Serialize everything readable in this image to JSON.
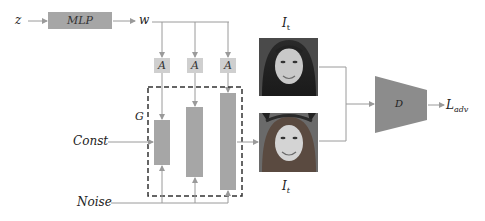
{
  "diagram": {
    "inputs": {
      "z": "z",
      "const": "Const",
      "noise": "Noise"
    },
    "mlp": {
      "label": "MLP"
    },
    "w": "w",
    "adain_blocks": [
      {
        "label": "A"
      },
      {
        "label": "A"
      },
      {
        "label": "A"
      }
    ],
    "generator": {
      "label": "G",
      "num_layers": 3
    },
    "images": {
      "real": {
        "label_main": "I",
        "label_sub": "t",
        "description": "real face image (dark hair, smiling)"
      },
      "generated": {
        "label_main": "I",
        "label_sub": "t",
        "description": "generated face image (cat-ear headband, smiling)"
      }
    },
    "discriminator": {
      "label": "D"
    },
    "loss": {
      "label_main": "L",
      "label_sub": "adv"
    },
    "colors": {
      "block": "#a6a6a6",
      "adain": "#cfcfcf",
      "line": "#9a9a9a",
      "dashed_border": "#333333",
      "text": "#222222"
    }
  }
}
